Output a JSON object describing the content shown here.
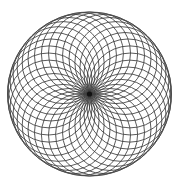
{
  "figure": {
    "kind": "geometric-line-art",
    "background_color": "#ffffff",
    "stroke_color": "#3c3c3c",
    "envelope_stroke_color": "#4a4a4a",
    "core_color": "#121212",
    "stroke_width": 0.85,
    "canvas": {
      "width": 181,
      "height": 186
    }
  },
  "chart_data": {
    "type": "scatter",
    "subtitle": "",
    "xlabel": "",
    "ylabel": "",
    "grid": false,
    "legend_position": "none",
    "xlim": [
      0,
      181
    ],
    "ylim": [
      0,
      186
    ],
    "annotations": [],
    "construction": {
      "pattern_name": "rosette",
      "center_x": 89.5,
      "center_y": 94.0,
      "envelope_radius": 82.0,
      "circle_radius": 41.0,
      "circle_center_radius": 41.0,
      "circle_count": 36,
      "angle_step_degrees": 10,
      "start_angle_degrees": -90,
      "core_dot_radius": 2.6,
      "all_circles_pass_through_center": true,
      "circles_tangent_to_envelope": true
    },
    "categories": [
      "circle-01",
      "circle-02",
      "circle-03",
      "circle-04",
      "circle-05",
      "circle-06",
      "circle-07",
      "circle-08",
      "circle-09",
      "circle-10",
      "circle-11",
      "circle-12",
      "circle-13",
      "circle-14",
      "circle-15",
      "circle-16",
      "circle-17",
      "circle-18",
      "circle-19",
      "circle-20",
      "circle-21",
      "circle-22",
      "circle-23",
      "circle-24",
      "circle-25",
      "circle-26",
      "circle-27",
      "circle-28",
      "circle-29",
      "circle-30",
      "circle-31",
      "circle-32",
      "circle-33",
      "circle-34",
      "circle-35",
      "circle-36"
    ],
    "values": [
      0,
      10,
      20,
      30,
      40,
      50,
      60,
      70,
      80,
      90,
      100,
      110,
      120,
      130,
      140,
      150,
      160,
      170,
      180,
      190,
      200,
      210,
      220,
      230,
      240,
      250,
      260,
      270,
      280,
      290,
      300,
      310,
      320,
      330,
      340,
      350
    ]
  }
}
